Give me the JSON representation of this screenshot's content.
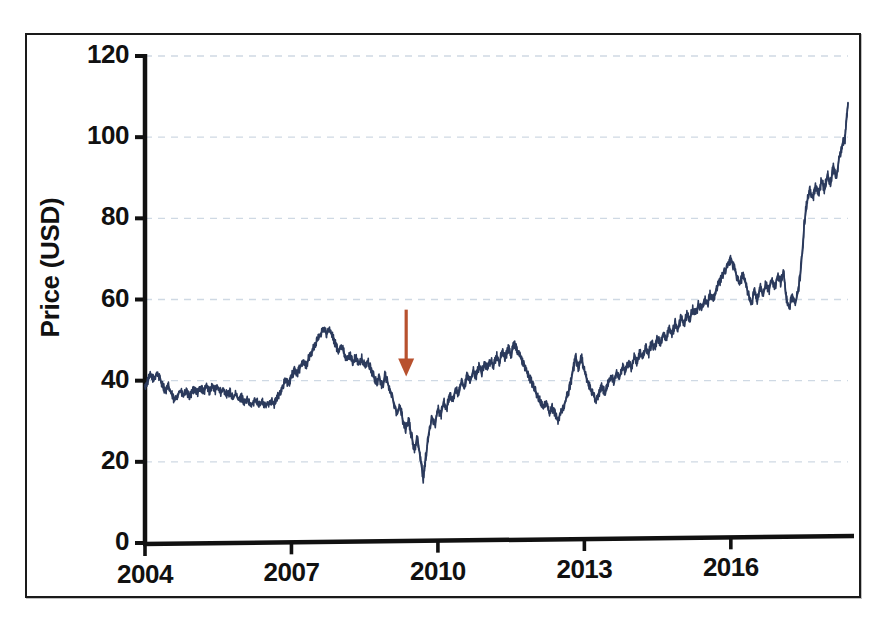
{
  "figure": {
    "kind": "scanned-figure",
    "background_color": "#ffffff",
    "frame_color": "#1a1a1a"
  },
  "chart_data": {
    "type": "line",
    "title": "",
    "subtitle": "",
    "xlabel": "",
    "ylabel": "Price (USD)",
    "x_tick_labels": [
      "2004",
      "2007",
      "2010",
      "2013",
      "2016"
    ],
    "x_tick_values": [
      2004,
      2007,
      2010,
      2013,
      2016
    ],
    "y_tick_labels": [
      "0",
      "20",
      "40",
      "60",
      "80",
      "100",
      "120"
    ],
    "y_tick_values": [
      0,
      20,
      40,
      60,
      80,
      100,
      120
    ],
    "xlim": [
      2004,
      2018.4
    ],
    "ylim": [
      0,
      120
    ],
    "grid": true,
    "grid_style": "dashed",
    "grid_color": "#cfd9e4",
    "legend": false,
    "legend_position": "none",
    "series": [
      {
        "name": "Price",
        "color": "#2b3a5c",
        "line_width": 1.6,
        "x": [
          2004.0,
          2004.06,
          2004.12,
          2004.18,
          2004.24,
          2004.3,
          2004.36,
          2004.42,
          2004.48,
          2004.54,
          2004.6,
          2004.66,
          2004.72,
          2004.78,
          2004.84,
          2004.9,
          2004.96,
          2005.02,
          2005.08,
          2005.14,
          2005.2,
          2005.26,
          2005.32,
          2005.38,
          2005.44,
          2005.5,
          2005.56,
          2005.62,
          2005.68,
          2005.74,
          2005.8,
          2005.86,
          2005.92,
          2005.98,
          2006.04,
          2006.1,
          2006.16,
          2006.22,
          2006.28,
          2006.34,
          2006.4,
          2006.46,
          2006.52,
          2006.58,
          2006.64,
          2006.7,
          2006.76,
          2006.82,
          2006.88,
          2006.94,
          2007.0,
          2007.06,
          2007.12,
          2007.18,
          2007.24,
          2007.3,
          2007.36,
          2007.42,
          2007.48,
          2007.54,
          2007.6,
          2007.66,
          2007.72,
          2007.78,
          2007.84,
          2007.9,
          2007.96,
          2008.02,
          2008.08,
          2008.14,
          2008.2,
          2008.26,
          2008.32,
          2008.38,
          2008.44,
          2008.5,
          2008.56,
          2008.62,
          2008.68,
          2008.74,
          2008.8,
          2008.86,
          2008.92,
          2008.98,
          2009.04,
          2009.1,
          2009.16,
          2009.22,
          2009.28,
          2009.34,
          2009.4,
          2009.46,
          2009.52,
          2009.58,
          2009.64,
          2009.7,
          2009.76,
          2009.82,
          2009.88,
          2009.94,
          2010.0,
          2010.06,
          2010.12,
          2010.18,
          2010.24,
          2010.3,
          2010.36,
          2010.42,
          2010.48,
          2010.54,
          2010.6,
          2010.66,
          2010.72,
          2010.78,
          2010.84,
          2010.9,
          2010.96,
          2011.02,
          2011.08,
          2011.14,
          2011.2,
          2011.26,
          2011.32,
          2011.38,
          2011.44,
          2011.5,
          2011.56,
          2011.62,
          2011.68,
          2011.74,
          2011.8,
          2011.86,
          2011.92,
          2011.98,
          2012.04,
          2012.1,
          2012.16,
          2012.22,
          2012.28,
          2012.34,
          2012.4,
          2012.46,
          2012.52,
          2012.58,
          2012.64,
          2012.7,
          2012.76,
          2012.82,
          2012.88,
          2012.94,
          2013.0,
          2013.06,
          2013.12,
          2013.18,
          2013.24,
          2013.3,
          2013.36,
          2013.42,
          2013.48,
          2013.54,
          2013.6,
          2013.66,
          2013.72,
          2013.78,
          2013.84,
          2013.9,
          2013.96,
          2014.02,
          2014.08,
          2014.14,
          2014.2,
          2014.26,
          2014.32,
          2014.38,
          2014.44,
          2014.5,
          2014.56,
          2014.62,
          2014.68,
          2014.74,
          2014.8,
          2014.86,
          2014.92,
          2014.98,
          2015.04,
          2015.1,
          2015.16,
          2015.22,
          2015.28,
          2015.34,
          2015.4,
          2015.46,
          2015.52,
          2015.58,
          2015.64,
          2015.7,
          2015.76,
          2015.82,
          2015.88,
          2015.94,
          2016.0,
          2016.06,
          2016.12,
          2016.18,
          2016.24,
          2016.3,
          2016.36,
          2016.42,
          2016.48,
          2016.54,
          2016.6,
          2016.66,
          2016.72,
          2016.78,
          2016.84,
          2016.9,
          2016.96,
          2017.02,
          2017.08,
          2017.14,
          2017.2,
          2017.26,
          2017.32,
          2017.38,
          2017.44,
          2017.5,
          2017.56,
          2017.62,
          2017.68,
          2017.74,
          2017.8,
          2017.86,
          2017.92,
          2017.98,
          2018.04,
          2018.1,
          2018.16,
          2018.22,
          2018.28,
          2018.34,
          2018.4
        ],
        "y": [
          38.5,
          40.0,
          41.5,
          40.2,
          42.0,
          40.6,
          39.0,
          37.4,
          38.6,
          36.8,
          35.0,
          36.4,
          37.6,
          36.2,
          37.4,
          36.0,
          37.0,
          38.2,
          37.0,
          38.4,
          37.2,
          38.6,
          37.4,
          38.8,
          37.6,
          38.4,
          37.0,
          37.8,
          36.4,
          37.2,
          35.8,
          36.6,
          35.2,
          36.0,
          34.6,
          35.2,
          33.8,
          34.6,
          35.4,
          34.2,
          34.8,
          33.6,
          34.4,
          35.2,
          34.0,
          35.6,
          37.0,
          38.6,
          40.2,
          39.0,
          41.0,
          42.8,
          41.6,
          43.4,
          45.0,
          43.8,
          45.6,
          47.2,
          48.8,
          50.2,
          51.6,
          53.0,
          51.4,
          52.6,
          50.8,
          49.0,
          47.4,
          48.8,
          46.8,
          45.0,
          46.4,
          44.6,
          45.8,
          44.0,
          45.4,
          43.6,
          44.8,
          43.0,
          41.2,
          39.4,
          40.8,
          38.6,
          41.4,
          39.2,
          36.8,
          34.6,
          32.0,
          33.8,
          30.4,
          28.0,
          30.2,
          26.4,
          23.0,
          26.2,
          20.6,
          16.2,
          22.0,
          27.4,
          31.0,
          29.2,
          33.0,
          31.4,
          34.8,
          33.2,
          36.4,
          35.0,
          38.0,
          36.6,
          39.6,
          38.0,
          41.2,
          39.6,
          42.6,
          41.0,
          43.6,
          42.0,
          44.4,
          43.0,
          45.0,
          43.8,
          46.2,
          44.6,
          47.0,
          45.4,
          48.0,
          46.4,
          49.2,
          47.6,
          46.0,
          44.4,
          42.8,
          41.2,
          39.6,
          38.0,
          36.4,
          34.8,
          33.2,
          34.6,
          32.0,
          33.4,
          31.8,
          30.4,
          32.2,
          34.0,
          36.0,
          38.4,
          42.0,
          46.0,
          43.0,
          45.6,
          42.4,
          40.0,
          38.2,
          36.6,
          35.0,
          36.8,
          38.6,
          37.0,
          39.2,
          41.0,
          40.0,
          42.2,
          41.0,
          43.4,
          42.0,
          44.6,
          43.2,
          45.8,
          44.4,
          47.0,
          45.6,
          48.2,
          46.8,
          49.4,
          48.0,
          50.6,
          49.2,
          51.8,
          50.4,
          53.0,
          51.6,
          54.2,
          52.8,
          55.4,
          54.0,
          56.6,
          55.2,
          57.8,
          56.4,
          59.0,
          57.6,
          60.2,
          58.8,
          61.4,
          60.0,
          62.6,
          64.0,
          65.6,
          67.0,
          68.4,
          70.0,
          68.0,
          65.8,
          63.6,
          66.0,
          64.0,
          61.4,
          59.0,
          62.0,
          60.0,
          63.0,
          61.0,
          64.0,
          62.2,
          65.0,
          63.0,
          66.0,
          64.2,
          67.0,
          60.0,
          58.0,
          61.0,
          59.0,
          62.0,
          68.0,
          78.0,
          84.0,
          86.8,
          85.0,
          88.0,
          86.0,
          89.5,
          87.0,
          91.0,
          88.5,
          93.0,
          90.0,
          95.0,
          98.0,
          100.0,
          108.5
        ]
      }
    ],
    "annotations": [
      {
        "type": "arrow",
        "name": "crisis-arrow",
        "direction": "down",
        "color": "#b8512e",
        "x": 2009.35,
        "y_start": 57.5,
        "y_end": 41.0,
        "label": ""
      }
    ]
  }
}
